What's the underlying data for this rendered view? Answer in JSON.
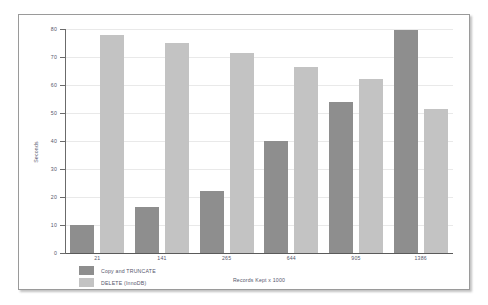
{
  "chart_data": {
    "type": "bar",
    "title": "",
    "xlabel": "Records Kept x 1000",
    "ylabel": "Seconds",
    "categories": [
      "21",
      "141",
      "265",
      "644",
      "905",
      "1386"
    ],
    "series": [
      {
        "name": "Copy and TRUNCATE",
        "color": "#8e8e8e",
        "values": [
          10,
          16.5,
          22,
          40,
          54,
          79.5
        ]
      },
      {
        "name": "DELETE (InnoDB)",
        "color": "#c3c3c3",
        "values": [
          78,
          75,
          71.5,
          66.5,
          62,
          51.5
        ]
      }
    ],
    "ylim": [
      0,
      80
    ],
    "yticks": [
      0,
      10,
      20,
      30,
      40,
      50,
      60,
      70,
      80
    ],
    "ytick_labels": [
      "0",
      "10",
      "20",
      "30",
      "40",
      "50",
      "60",
      "70",
      "80"
    ],
    "grid": true,
    "legend_position": "bottom-left"
  },
  "figure": {
    "background": "#ffffff",
    "border_color": "#9a9a9a",
    "axis_color": "#6b6b6b",
    "gridline_color": "#e9e9e9",
    "text_color": "#55566b"
  }
}
